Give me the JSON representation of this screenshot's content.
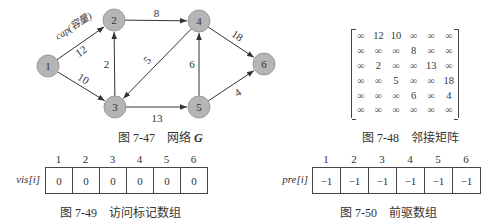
{
  "network_figure": {
    "caption_number": "图 7-47",
    "caption_text": "网络",
    "caption_symbol": "G",
    "edge_label_note": "cap(容量)",
    "nodes": [
      {
        "id": "1",
        "x": 48,
        "y": 66
      },
      {
        "id": "2",
        "x": 114,
        "y": 20
      },
      {
        "id": "3",
        "x": 115,
        "y": 107
      },
      {
        "id": "4",
        "x": 199,
        "y": 21
      },
      {
        "id": "5",
        "x": 199,
        "y": 107
      },
      {
        "id": "6",
        "x": 264,
        "y": 64
      }
    ],
    "edges": [
      {
        "from": "1",
        "to": "2",
        "cap": "12"
      },
      {
        "from": "1",
        "to": "3",
        "cap": "10"
      },
      {
        "from": "2",
        "to": "4",
        "cap": "8"
      },
      {
        "from": "3",
        "to": "2",
        "cap": "2"
      },
      {
        "from": "4",
        "to": "3",
        "cap": "5"
      },
      {
        "from": "3",
        "to": "5",
        "cap": "13"
      },
      {
        "from": "5",
        "to": "4",
        "cap": "6"
      },
      {
        "from": "4",
        "to": "6",
        "cap": "18"
      },
      {
        "from": "5",
        "to": "6",
        "cap": "4"
      }
    ],
    "node_fill": "#b5b5b5",
    "node_stroke": "#9a9a9a",
    "edge_color": "#333333"
  },
  "adjacency_matrix": {
    "caption_number": "图 7-48",
    "caption_text": "邻接矩阵",
    "rows": [
      [
        "∞",
        "12",
        "10",
        "∞",
        "∞",
        "∞"
      ],
      [
        "∞",
        "∞",
        "∞",
        "8",
        "∞",
        "∞"
      ],
      [
        "∞",
        "2",
        "∞",
        "∞",
        "13",
        "∞"
      ],
      [
        "∞",
        "∞",
        "5",
        "∞",
        "∞",
        "18"
      ],
      [
        "∞",
        "∞",
        "∞",
        "6",
        "∞",
        "4"
      ],
      [
        "∞",
        "∞",
        "∞",
        "∞",
        "∞",
        "∞"
      ]
    ]
  },
  "vis_array": {
    "label": "vis[i]",
    "indices": [
      "1",
      "2",
      "3",
      "4",
      "5",
      "6"
    ],
    "values": [
      "0",
      "0",
      "0",
      "0",
      "0",
      "0"
    ],
    "caption_number": "图 7-49",
    "caption_text": "访问标记数组"
  },
  "pre_array": {
    "label": "pre[i]",
    "indices": [
      "1",
      "2",
      "3",
      "4",
      "5",
      "6"
    ],
    "values": [
      "−1",
      "−1",
      "−1",
      "−1",
      "−1",
      "−1"
    ],
    "caption_number": "图 7-50",
    "caption_text": "前驱数组"
  }
}
